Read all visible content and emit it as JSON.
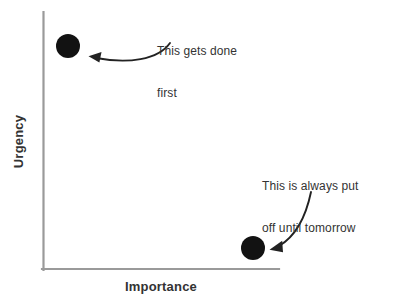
{
  "chart_data": {
    "type": "scatter",
    "title": "",
    "xlabel": "Importance",
    "ylabel": "Urgency",
    "xlim": [
      0,
      100
    ],
    "ylim": [
      0,
      100
    ],
    "grid": false,
    "legend": false,
    "axis_color": "#9a9a9a",
    "point_color": "#121212",
    "text_color": "#333333",
    "background_color": "#ffffff",
    "points": [
      {
        "label": "high-urgency-low-importance",
        "x": 11,
        "y": 87,
        "radius": 12,
        "color": "#121212"
      },
      {
        "label": "low-urgency-high-importance",
        "x": 89,
        "y": 9,
        "radius": 12,
        "color": "#121212"
      }
    ],
    "annotations": [
      {
        "id": "annotation-0",
        "lines": [
          "This gets done",
          "first"
        ],
        "target_point": "high-urgency-low-importance",
        "arrow": "curved-left"
      },
      {
        "id": "annotation-1",
        "lines": [
          "This is always put",
          "off until tomorrow"
        ],
        "target_point": "low-urgency-high-importance",
        "arrow": "curved-down-left"
      }
    ]
  },
  "axes": {
    "x_label": "Importance",
    "y_label": "Urgency"
  },
  "annotations": [
    {
      "line1": "This gets done",
      "line2": "first"
    },
    {
      "line1": "This is always put",
      "line2": "off until tomorrow"
    }
  ]
}
